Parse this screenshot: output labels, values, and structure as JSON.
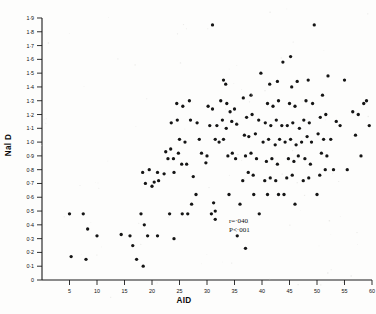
{
  "figure": {
    "background_color": "#fdfdfc",
    "point_color": "#151515",
    "axis_color": "#1a1a1a"
  },
  "axes": {
    "x_title": "AID",
    "y_title": "Nal D",
    "x_ticks": [
      "5",
      "10",
      "15",
      "20",
      "25",
      "30",
      "35",
      "40",
      "45",
      "50",
      "55",
      "60"
    ],
    "y_ticks": [
      "0",
      "0·1",
      "0·2",
      "0·3",
      "0·4",
      "0·5",
      "0·6",
      "0·7",
      "0·8",
      "0·9",
      "1·0",
      "1·1",
      "1·2",
      "1·3",
      "1·4",
      "1·5",
      "1·6",
      "1·7",
      "1·8",
      "1·9"
    ]
  },
  "annotations": {
    "r_value": "r=·040",
    "p_value": "P<·001"
  },
  "chart_data": {
    "type": "scatter",
    "title": "",
    "xlabel": "AID",
    "ylabel": "Nal D",
    "xlim": [
      0,
      62
    ],
    "ylim": [
      0,
      1.95
    ],
    "xticks": [
      5,
      10,
      15,
      20,
      25,
      30,
      35,
      40,
      45,
      50,
      55,
      60
    ],
    "yticks": [
      0,
      0.1,
      0.2,
      0.3,
      0.4,
      0.5,
      0.6,
      0.7,
      0.8,
      0.9,
      1.0,
      1.1,
      1.2,
      1.3,
      1.4,
      1.5,
      1.6,
      1.7,
      1.8,
      1.9
    ],
    "grid": false,
    "legend": false,
    "annotations": [
      "r=·040",
      "P<·001"
    ],
    "series": [
      {
        "name": "subjects",
        "marker": "filled-circle",
        "color": "#151515",
        "points": [
          [
            5.0,
            0.48
          ],
          [
            7.5,
            0.48
          ],
          [
            8.3,
            0.37
          ],
          [
            5.3,
            0.17
          ],
          [
            8.0,
            0.15
          ],
          [
            18.0,
            0.48
          ],
          [
            18.6,
            0.4
          ],
          [
            17.2,
            0.15
          ],
          [
            18.4,
            0.1
          ],
          [
            14.4,
            0.33
          ],
          [
            10.0,
            0.32
          ],
          [
            16.0,
            0.32
          ],
          [
            19.2,
            0.32
          ],
          [
            21.0,
            0.32
          ],
          [
            16.5,
            0.25
          ],
          [
            23.2,
            0.48
          ],
          [
            25.5,
            0.48
          ],
          [
            24.0,
            0.3
          ],
          [
            30.8,
            0.48
          ],
          [
            35.5,
            0.32
          ],
          [
            37.0,
            0.23
          ],
          [
            41.0,
            0.62
          ],
          [
            18.3,
            0.78
          ],
          [
            19.5,
            0.8
          ],
          [
            20.4,
            0.71
          ],
          [
            21.2,
            0.72
          ],
          [
            18.8,
            0.7
          ],
          [
            20.0,
            0.68
          ],
          [
            22.5,
            0.93
          ],
          [
            23.4,
            0.95
          ],
          [
            22.9,
            0.88
          ],
          [
            23.9,
            0.88
          ],
          [
            24.8,
            0.92
          ],
          [
            25.4,
            0.84
          ],
          [
            26.3,
            0.84
          ],
          [
            21.0,
            0.78
          ],
          [
            22.2,
            0.77
          ],
          [
            24.0,
            0.78
          ],
          [
            25.0,
            1.02
          ],
          [
            26.0,
            1.0
          ],
          [
            27.5,
            0.75
          ],
          [
            29.0,
            0.92
          ],
          [
            30.0,
            0.9
          ],
          [
            29.8,
            0.85
          ],
          [
            31.5,
            1.02
          ],
          [
            32.2,
            1.0
          ],
          [
            33.0,
            1.02
          ],
          [
            33.8,
            0.9
          ],
          [
            34.6,
            0.92
          ],
          [
            35.2,
            0.88
          ],
          [
            30.5,
            1.12
          ],
          [
            31.8,
            1.12
          ],
          [
            32.8,
            1.16
          ],
          [
            33.5,
            1.1
          ],
          [
            34.5,
            1.15
          ],
          [
            35.4,
            1.13
          ],
          [
            30.2,
            1.26
          ],
          [
            31.0,
            1.24
          ],
          [
            32.5,
            1.3
          ],
          [
            33.6,
            1.28
          ],
          [
            34.2,
            1.22
          ],
          [
            35.0,
            1.24
          ],
          [
            33.0,
            1.45
          ],
          [
            33.4,
            1.42
          ],
          [
            31.0,
            1.85
          ],
          [
            36.5,
            0.72
          ],
          [
            37.5,
            0.78
          ],
          [
            38.4,
            0.76
          ],
          [
            37.0,
            0.9
          ],
          [
            38.0,
            0.92
          ],
          [
            39.0,
            0.88
          ],
          [
            36.8,
            1.05
          ],
          [
            37.6,
            1.04
          ],
          [
            38.8,
            1.06
          ],
          [
            37.2,
            1.18
          ],
          [
            38.2,
            1.2
          ],
          [
            39.4,
            1.16
          ],
          [
            36.6,
            1.32
          ],
          [
            38.0,
            1.34
          ],
          [
            39.8,
            1.5
          ],
          [
            40.5,
            0.72
          ],
          [
            41.5,
            0.74
          ],
          [
            42.5,
            0.72
          ],
          [
            40.8,
            0.86
          ],
          [
            41.8,
            0.88
          ],
          [
            42.8,
            0.84
          ],
          [
            40.2,
            1.0
          ],
          [
            41.2,
            1.02
          ],
          [
            42.4,
            0.98
          ],
          [
            43.2,
            1.02
          ],
          [
            40.6,
            1.14
          ],
          [
            41.6,
            1.12
          ],
          [
            42.6,
            1.16
          ],
          [
            43.6,
            1.12
          ],
          [
            41.0,
            1.28
          ],
          [
            42.0,
            1.26
          ],
          [
            43.0,
            1.3
          ],
          [
            41.4,
            1.42
          ],
          [
            42.8,
            1.44
          ],
          [
            43.8,
            1.58
          ],
          [
            44.5,
            0.74
          ],
          [
            45.5,
            0.76
          ],
          [
            44.8,
            0.88
          ],
          [
            45.8,
            0.86
          ],
          [
            46.6,
            0.9
          ],
          [
            44.2,
            1.0
          ],
          [
            45.2,
            1.02
          ],
          [
            46.2,
            0.98
          ],
          [
            44.6,
            1.12
          ],
          [
            45.6,
            1.14
          ],
          [
            46.8,
            1.1
          ],
          [
            45.0,
            1.28
          ],
          [
            46.0,
            1.26
          ],
          [
            45.4,
            1.4
          ],
          [
            46.4,
            1.44
          ],
          [
            45.2,
            1.62
          ],
          [
            47.5,
            0.72
          ],
          [
            48.5,
            0.74
          ],
          [
            47.8,
            0.88
          ],
          [
            48.8,
            0.84
          ],
          [
            47.2,
            1.0
          ],
          [
            48.2,
            1.04
          ],
          [
            49.0,
            1.0
          ],
          [
            47.6,
            1.16
          ],
          [
            48.6,
            1.14
          ],
          [
            48.0,
            1.3
          ],
          [
            49.2,
            1.28
          ],
          [
            48.4,
            1.45
          ],
          [
            49.5,
            1.85
          ],
          [
            50.5,
            0.76
          ],
          [
            51.5,
            0.8
          ],
          [
            50.8,
            0.92
          ],
          [
            51.8,
            0.9
          ],
          [
            50.2,
            1.06
          ],
          [
            51.2,
            1.02
          ],
          [
            50.6,
            1.18
          ],
          [
            51.6,
            1.2
          ],
          [
            51.0,
            1.34
          ],
          [
            52.0,
            1.48
          ],
          [
            53.5,
            1.15
          ],
          [
            54.2,
            1.12
          ],
          [
            55.0,
            1.45
          ],
          [
            53.0,
            0.8
          ],
          [
            56.5,
            1.22
          ],
          [
            57.5,
            1.2
          ],
          [
            58.5,
            1.28
          ],
          [
            59.0,
            1.3
          ],
          [
            57.0,
            1.05
          ],
          [
            58.0,
            0.9
          ],
          [
            59.5,
            1.12
          ],
          [
            28.0,
            0.62
          ],
          [
            34.0,
            0.62
          ],
          [
            38.5,
            0.62
          ],
          [
            43.0,
            0.62
          ],
          [
            27.2,
            0.55
          ],
          [
            31.2,
            0.56
          ],
          [
            36.0,
            0.55
          ],
          [
            50.0,
            0.62
          ],
          [
            26.5,
            0.48
          ],
          [
            31.5,
            0.44
          ],
          [
            31.5,
            0.5
          ],
          [
            27.0,
            1.16
          ],
          [
            28.2,
            1.14
          ],
          [
            26.8,
            1.3
          ],
          [
            28.6,
            1.02
          ],
          [
            24.5,
            1.28
          ],
          [
            25.6,
            1.26
          ],
          [
            23.5,
            1.14
          ],
          [
            24.6,
            1.16
          ],
          [
            52.5,
            1.02
          ],
          [
            44.0,
            0.62
          ],
          [
            46.0,
            0.55
          ],
          [
            55.5,
            0.8
          ],
          [
            39.5,
            0.48
          ]
        ]
      }
    ]
  }
}
